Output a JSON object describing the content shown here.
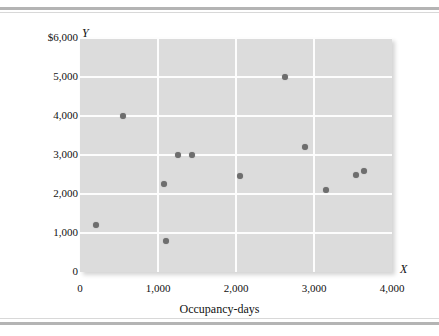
{
  "chart_data": {
    "type": "scatter",
    "title": "",
    "xlabel": "Occupancy-days",
    "ylabel": "Total telephone costs",
    "x_axis_symbol": "X",
    "y_axis_symbol": "Y",
    "xlim": [
      0,
      4000
    ],
    "ylim": [
      0,
      6000
    ],
    "grid": true,
    "legend": "none",
    "marker_color": "#6e6e6e",
    "plot_background_color": "#dcdcdc",
    "gridline_color": "#fdfdfd",
    "xticks": [
      {
        "value": 0,
        "label": "0"
      },
      {
        "value": 1000,
        "label": "1,000"
      },
      {
        "value": 2000,
        "label": "2,000"
      },
      {
        "value": 3000,
        "label": "3,000"
      },
      {
        "value": 4000,
        "label": "4,000"
      }
    ],
    "yticks": [
      {
        "value": 0,
        "label": "0"
      },
      {
        "value": 1000,
        "label": "1,000"
      },
      {
        "value": 2000,
        "label": "2,000"
      },
      {
        "value": 3000,
        "label": "3,000"
      },
      {
        "value": 4000,
        "label": "4,000"
      },
      {
        "value": 5000,
        "label": "5,000"
      },
      {
        "value": 6000,
        "label": "$6,000"
      }
    ],
    "points": [
      {
        "x": 200,
        "y": 1200
      },
      {
        "x": 550,
        "y": 4000
      },
      {
        "x": 1080,
        "y": 2250
      },
      {
        "x": 1100,
        "y": 800
      },
      {
        "x": 1250,
        "y": 3000
      },
      {
        "x": 1430,
        "y": 3000
      },
      {
        "x": 2050,
        "y": 2450
      },
      {
        "x": 2630,
        "y": 5000
      },
      {
        "x": 2885,
        "y": 3200
      },
      {
        "x": 3160,
        "y": 2100
      },
      {
        "x": 3540,
        "y": 2500
      },
      {
        "x": 3640,
        "y": 2600
      }
    ]
  }
}
